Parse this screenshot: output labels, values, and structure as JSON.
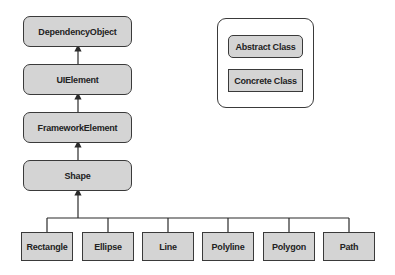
{
  "diagram": {
    "title": "",
    "hierarchy": [
      {
        "id": "dependency-object",
        "label": "DependencyObject",
        "kind": "abstract"
      },
      {
        "id": "ui-element",
        "label": "UIElement",
        "kind": "abstract",
        "parent": "dependency-object"
      },
      {
        "id": "framework-element",
        "label": "FrameworkElement",
        "kind": "abstract",
        "parent": "ui-element"
      },
      {
        "id": "shape",
        "label": "Shape",
        "kind": "abstract",
        "parent": "framework-element"
      }
    ],
    "children": [
      {
        "id": "rectangle",
        "label": "Rectangle",
        "kind": "concrete",
        "parent": "shape"
      },
      {
        "id": "ellipse",
        "label": "Ellipse",
        "kind": "concrete",
        "parent": "shape"
      },
      {
        "id": "line",
        "label": "Line",
        "kind": "concrete",
        "parent": "shape"
      },
      {
        "id": "polyline",
        "label": "Polyline",
        "kind": "concrete",
        "parent": "shape"
      },
      {
        "id": "polygon",
        "label": "Polygon",
        "kind": "concrete",
        "parent": "shape"
      },
      {
        "id": "path",
        "label": "Path",
        "kind": "concrete",
        "parent": "shape"
      }
    ]
  },
  "legend": {
    "abstract_label": "Abstract Class",
    "concrete_label": "Concrete Class"
  },
  "colors": {
    "node_fill": "#d4d4d4",
    "stroke": "#3a3a3a",
    "background": "#ffffff"
  }
}
